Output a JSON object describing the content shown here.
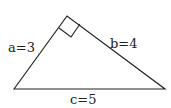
{
  "diagram": {
    "type": "right-triangle",
    "labels": {
      "a": "a=3",
      "b": "b=4",
      "c": "c=5"
    },
    "vertices": {
      "left": [
        14,
        89
      ],
      "top": [
        67,
        16
      ],
      "right": [
        165,
        89
      ]
    },
    "right_angle_marker": true,
    "stroke_color": "#222222"
  }
}
